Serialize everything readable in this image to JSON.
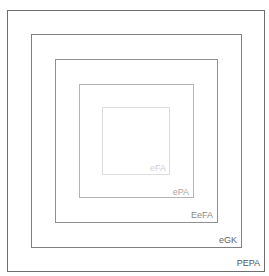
{
  "diagram": {
    "type": "nested-squares",
    "levels": [
      {
        "label": "PEPA",
        "color": "#6e6e6e"
      },
      {
        "label": "eGK",
        "color": "#808080"
      },
      {
        "label": "EeFA",
        "color": "#8f8f8f"
      },
      {
        "label": "ePA",
        "color": "#b5b5b5"
      },
      {
        "label": "eFA",
        "color": "#dcdcdc"
      }
    ]
  }
}
